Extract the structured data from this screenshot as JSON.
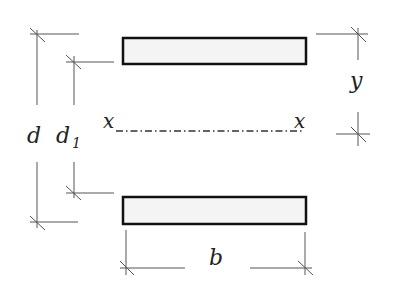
{
  "diagram": {
    "type": "cross-section dimension sketch",
    "labels": {
      "d": "d",
      "d1": "d",
      "d1_sub": "1",
      "y": "y",
      "b": "b",
      "x_left": "x",
      "x_right": "x"
    },
    "elements": {
      "top_plate": {
        "x": 123,
        "y": 38,
        "w": 183,
        "h": 26
      },
      "bottom_plate": {
        "x": 123,
        "y": 197,
        "w": 183,
        "h": 27
      },
      "neutral_axis_y": 130
    },
    "colors": {
      "line": "#3a3a3a",
      "plate_fill": "#f4f4f4",
      "plate_stroke": "#111111"
    }
  }
}
